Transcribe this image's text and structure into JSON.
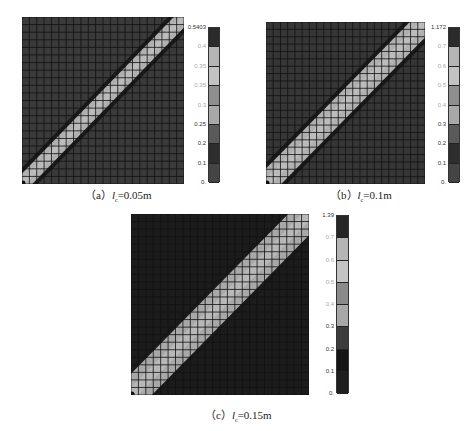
{
  "chart_data": [
    {
      "type": "heatmap",
      "title": "(a) l_c = 0.05m",
      "caption": {
        "prefix": "（a）",
        "var": "l",
        "sub": "c",
        "value": "=0.05m"
      },
      "grid": {
        "rows": 22,
        "cols": 22
      },
      "band": {
        "orientation": "diagonal bottom-left to top-right",
        "width_cells": 2
      },
      "colorbar": {
        "max_label": "0.5403",
        "ticks": [
          "0.5403",
          "0.4",
          "0.35",
          "0.35",
          "0.3",
          "0.25",
          "0.2",
          "0.1",
          "0."
        ],
        "colors": [
          "#2b2b2b",
          "#b5b5b5",
          "#c2c2c2",
          "#8e8e8e",
          "#a8a8a8",
          "#5a5a5a",
          "#2e2e2e",
          "#444444"
        ]
      },
      "background_color": "#3a3a3a",
      "band_color": "#b0b0b0"
    },
    {
      "type": "heatmap",
      "title": "(b) l_c = 0.1m",
      "caption": {
        "prefix": "（b）",
        "var": "l",
        "sub": "c",
        "value": "=0.1m"
      },
      "grid": {
        "rows": 22,
        "cols": 22
      },
      "band": {
        "orientation": "diagonal bottom-left to top-right",
        "width_cells": 3
      },
      "colorbar": {
        "max_label": "1.172",
        "ticks": [
          "1.172",
          "0.7",
          "0.6",
          "0.5",
          "0.4",
          "0.3",
          "0.2",
          "0.1",
          "0."
        ],
        "colors": [
          "#2b2b2b",
          "#b5b5b5",
          "#c2c2c2",
          "#8e8e8e",
          "#a8a8a8",
          "#5a5a5a",
          "#2e2e2e",
          "#444444"
        ]
      },
      "background_color": "#363636",
      "band_color": "#b0b0b0"
    },
    {
      "type": "heatmap",
      "title": "(c) l_c = 0.15m",
      "caption": {
        "prefix": "（c）",
        "var": "l",
        "sub": "c",
        "value": "=0.15m"
      },
      "grid": {
        "rows": 24,
        "cols": 24
      },
      "band": {
        "orientation": "diagonal bottom-left to top-right",
        "width_cells": 4
      },
      "colorbar": {
        "max_label": "1.39",
        "ticks": [
          "1.39",
          "0.7",
          "0.6",
          "0.5",
          "0.4",
          "0.3",
          "0.2",
          "0.1",
          "0."
        ],
        "colors": [
          "#262626",
          "#b5b5b5",
          "#c4c4c4",
          "#8a8a8a",
          "#a8a8a8",
          "#3c3c3c",
          "#151515",
          "#1e1e1e"
        ]
      },
      "background_color": "#1c1c1c",
      "band_color": "#a8a8a8"
    }
  ],
  "panels": {
    "a": {
      "caption_prefix": "（a）",
      "caption_var": "l",
      "caption_sub": "c",
      "caption_value": "=0.05m"
    },
    "b": {
      "caption_prefix": "（b）",
      "caption_var": "l",
      "caption_sub": "c",
      "caption_value": "=0.1m"
    },
    "c": {
      "caption_prefix": "（c）",
      "caption_var": "l",
      "caption_sub": "c",
      "caption_value": "=0.15m"
    }
  }
}
